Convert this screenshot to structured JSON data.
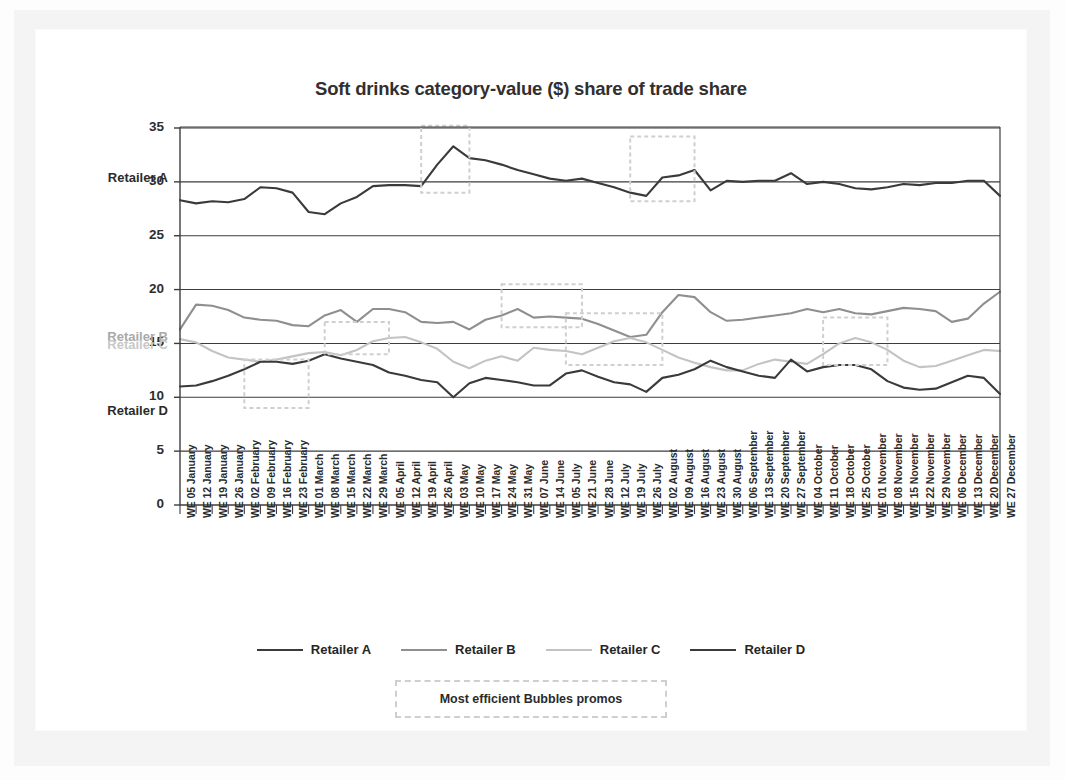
{
  "chart_data": {
    "type": "line",
    "title": "Soft drinks category-value ($) share of trade share",
    "xlabel": "",
    "ylabel": "",
    "ylim": [
      0,
      35
    ],
    "yticks": [
      0,
      5,
      10,
      15,
      20,
      25,
      30,
      35
    ],
    "grid": true,
    "legend_position": "bottom",
    "categories": [
      "WE 05 January",
      "WE 12 January",
      "WE 19 January",
      "WE 26 January",
      "WE 02 February",
      "WE 09 February",
      "WE 16 February",
      "WE 23 February",
      "WE 01 March",
      "WE 08 March",
      "WE 15 March",
      "WE 22 March",
      "WE 29 March",
      "WE 05 April",
      "WE 12 April",
      "WE 19 April",
      "WE 26 April",
      "WE 03 May",
      "WE 10 May",
      "WE 17 May",
      "WE 24 May",
      "WE 31 May",
      "WE 07 June",
      "WE 14 June",
      "WE 05 July",
      "WE 21 June",
      "WE 28 June",
      "WE 12 July",
      "WE 19 July",
      "WE 26 July",
      "WE 02 August",
      "WE 09 August",
      "WE 16 August",
      "WE 23 August",
      "WE 30 August",
      "WE 06 September",
      "WE 13 September",
      "WE 20 September",
      "WE 27 September",
      "WE 04 October",
      "WE 11 October",
      "WE 18 October",
      "WE 25 October",
      "WE 01 November",
      "WE 08 November",
      "WE 15 November",
      "WE 22 November",
      "WE 29 November",
      "WE 06 December",
      "WE 13 December",
      "WE 20 December",
      "WE 27 December"
    ],
    "series": [
      {
        "name": "Retailer A",
        "color": "#3a3a3a",
        "values": [
          28.3,
          28.0,
          28.2,
          28.1,
          28.4,
          29.5,
          29.4,
          29.0,
          27.2,
          27.0,
          28.0,
          28.6,
          29.6,
          29.7,
          29.7,
          29.6,
          31.6,
          33.3,
          32.2,
          32.0,
          31.6,
          31.1,
          30.7,
          30.3,
          30.1,
          30.3,
          29.9,
          29.5,
          29.0,
          28.7,
          30.4,
          30.6,
          31.1,
          29.2,
          30.1,
          30.0,
          30.1,
          30.1,
          30.8,
          29.8,
          30.0,
          29.8,
          29.4,
          29.3,
          29.5,
          29.8,
          29.7,
          29.9,
          29.9,
          30.1,
          30.1,
          28.7
        ]
      },
      {
        "name": "Retailer B",
        "color": "#8f8f8f",
        "values": [
          16.3,
          18.6,
          18.5,
          18.1,
          17.4,
          17.2,
          17.1,
          16.7,
          16.6,
          17.6,
          18.1,
          17.0,
          18.2,
          18.2,
          17.9,
          17.0,
          16.9,
          17.0,
          16.3,
          17.2,
          17.6,
          18.2,
          17.4,
          17.5,
          17.4,
          17.3,
          16.8,
          16.2,
          15.6,
          15.8,
          17.9,
          19.5,
          19.3,
          17.9,
          17.1,
          17.2,
          17.4,
          17.6,
          17.8,
          18.2,
          17.9,
          18.2,
          17.8,
          17.7,
          18.0,
          18.3,
          18.2,
          18.0,
          17.0,
          17.3,
          18.7,
          19.8
        ]
      },
      {
        "name": "Retailer C",
        "color": "#c3c3c3",
        "values": [
          15.4,
          15.1,
          14.3,
          13.7,
          13.5,
          13.3,
          13.5,
          13.8,
          14.1,
          14.2,
          13.9,
          14.4,
          15.2,
          15.5,
          15.6,
          15.1,
          14.5,
          13.3,
          12.7,
          13.4,
          13.8,
          13.4,
          14.6,
          14.4,
          14.3,
          14.0,
          14.6,
          15.2,
          15.5,
          15.1,
          14.4,
          13.7,
          13.2,
          12.8,
          12.5,
          12.5,
          13.1,
          13.5,
          13.3,
          13.1,
          14.0,
          15.0,
          15.5,
          15.1,
          14.4,
          13.4,
          12.8,
          12.9,
          13.4,
          13.9,
          14.4,
          14.3
        ]
      },
      {
        "name": "Retailer D",
        "color": "#3a3a3a",
        "values": [
          11.0,
          11.1,
          11.5,
          12.0,
          12.6,
          13.3,
          13.3,
          13.1,
          13.4,
          14.0,
          13.6,
          13.3,
          13.0,
          12.3,
          12.0,
          11.6,
          11.4,
          10.0,
          11.3,
          11.8,
          11.6,
          11.4,
          11.1,
          11.1,
          12.2,
          12.5,
          11.9,
          11.4,
          11.2,
          10.5,
          11.8,
          12.1,
          12.6,
          13.4,
          12.8,
          12.4,
          12.0,
          11.8,
          13.5,
          12.4,
          12.8,
          13.0,
          13.0,
          12.6,
          11.5,
          10.9,
          10.7,
          10.8,
          11.4,
          12.0,
          11.8,
          10.3
        ]
      }
    ],
    "side_labels": [
      {
        "text": "Retailer A",
        "color": "#2b2b2b"
      },
      {
        "text": "Retailer B",
        "color": "#a9a9a9"
      },
      {
        "text": "Retailer C",
        "color": "#c8c8c8"
      },
      {
        "text": "Retailer D",
        "color": "#2b2b2b"
      }
    ],
    "annotations": {
      "note_label": "Most efficient Bubbles promos",
      "box_color": "#cfcfcf",
      "boxes": [
        {
          "x_start": "WE 19 April",
          "x_end": "WE 10 May",
          "y_low": 29.0,
          "y_high": 35.2
        },
        {
          "x_start": "WE 19 July",
          "x_end": "WE 16 August",
          "y_low": 28.2,
          "y_high": 34.2
        },
        {
          "x_start": "WE 24 May",
          "x_end": "WE 21 June",
          "y_low": 16.5,
          "y_high": 20.5
        },
        {
          "x_start": "WE 05 July",
          "x_end": "WE 02 August",
          "y_low": 13.0,
          "y_high": 17.8
        },
        {
          "x_start": "WE 08 March",
          "x_end": "WE 05 April",
          "y_low": 14.0,
          "y_high": 17.0
        },
        {
          "x_start": "WE 02 February",
          "x_end": "WE 01 March",
          "y_low": 9.0,
          "y_high": 13.5
        },
        {
          "x_start": "WE 11 October",
          "x_end": "WE 08 November",
          "y_low": 13.0,
          "y_high": 17.4
        }
      ]
    }
  }
}
